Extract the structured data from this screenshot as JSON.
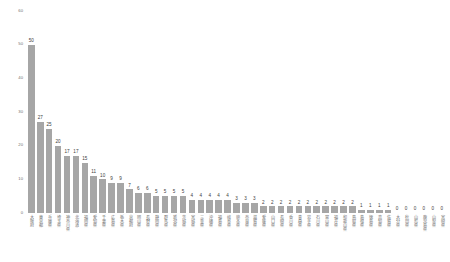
{
  "chart_data": {
    "type": "bar",
    "title": "",
    "subtitle": "",
    "xlabel": "",
    "ylabel": "",
    "ylim": [
      0,
      60
    ],
    "yticks": [
      0,
      10,
      20,
      30,
      40,
      50,
      60
    ],
    "grid": false,
    "legend": null,
    "bar_color": "#a6a6a6",
    "value_label_color": "#3d3d3d",
    "tick_label_color": "#6f6f6f",
    "background": "#ffffff",
    "categories": [
      "大阪府",
      "東京都",
      "兵庫県",
      "埼玉県",
      "神奈川県",
      "北海道",
      "福岡県",
      "愛知県",
      "千葉県",
      "広島県",
      "栃木県",
      "京都府",
      "岡山県",
      "長野県",
      "静岡県",
      "群馬県",
      "新潟県",
      "茨城県",
      "宮城県",
      "三重県",
      "沖縄県",
      "福島県",
      "岐阜県",
      "熊本県",
      "奈良県",
      "滋賀県",
      "愛媛県",
      "山口県",
      "長崎県",
      "香川県",
      "青森県",
      "岩手県",
      "石川県",
      "富山県",
      "福井県",
      "和歌山県",
      "鳥取県",
      "島根県",
      "徳島県",
      "高知県",
      "佐賀県",
      "大分県",
      "秋田県",
      "山形県",
      "鹿児島県",
      "山梨県",
      "宮崎県"
    ],
    "values": [
      50,
      27,
      25,
      20,
      17,
      17,
      15,
      11,
      10,
      9,
      9,
      7,
      6,
      6,
      5,
      5,
      5,
      5,
      4,
      4,
      4,
      4,
      4,
      3,
      3,
      3,
      2,
      2,
      2,
      2,
      2,
      2,
      2,
      2,
      2,
      2,
      2,
      1,
      1,
      1,
      1,
      0,
      0,
      0,
      0,
      0,
      0
    ]
  }
}
